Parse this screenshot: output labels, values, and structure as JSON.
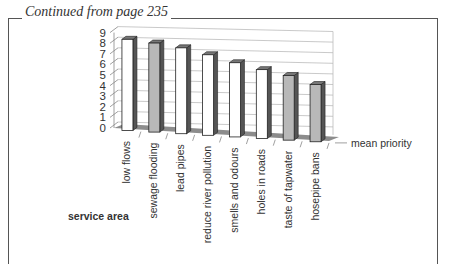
{
  "caption": "Continued from page 235",
  "chart_data": {
    "type": "bar",
    "style": "3d-column",
    "title": "",
    "xlabel": "service area",
    "ylabel": "",
    "series": [
      {
        "name": "mean priority",
        "values": [
          8.6,
          8.4,
          8.1,
          7.6,
          7.0,
          6.5,
          6.1,
          5.4
        ]
      }
    ],
    "categories": [
      "low flows",
      "sewage flooding",
      "lead pipes",
      "reduce river pollution",
      "smells and odours",
      "holes in roads",
      "taste of tapwater",
      "hosepipe bans"
    ],
    "bar_fill": [
      "white",
      "gray",
      "white",
      "white",
      "white",
      "white",
      "gray",
      "gray"
    ],
    "yticks": [
      "0",
      "1",
      "2",
      "3",
      "4",
      "5",
      "6",
      "7",
      "8",
      "9"
    ],
    "ylim": [
      0,
      9
    ],
    "grid": true,
    "legend": "none",
    "depth_axis_label": "mean priority"
  },
  "colors": {
    "white_bar": "#ffffff",
    "gray_bar": "#b8b8b8",
    "side": "#555555",
    "floor": "#8c8c8c",
    "grid": "#bbbbbb",
    "text": "#333333"
  }
}
